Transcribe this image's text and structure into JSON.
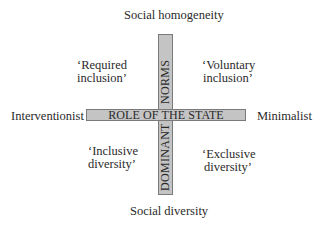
{
  "diagram": {
    "type": "quadrant",
    "center_label": "ROLE OF THE STATE",
    "vertical_bar": {
      "upper_text": "NORMS",
      "lower_text": "DOMINANT",
      "full_reading": "DOMINANT NORMS"
    },
    "axes": {
      "top": "Social homogeneity",
      "bottom": "Social diversity",
      "left": "Interventionist",
      "right": "Minimalist"
    },
    "quadrants": {
      "top_left": {
        "line1": "‘Required",
        "line2": "inclusion’"
      },
      "top_right": {
        "line1": "‘Voluntary",
        "line2": "inclusion’"
      },
      "bottom_left": {
        "line1": "‘Inclusive",
        "line2": "diversity’"
      },
      "bottom_right": {
        "line1": "‘Exclusive",
        "line2": "diversity’"
      }
    },
    "colors": {
      "bar_fill": "#c4c4c4",
      "bar_border": "#7a7a7a",
      "text": "#2a2a2a",
      "background": "#ffffff"
    }
  }
}
